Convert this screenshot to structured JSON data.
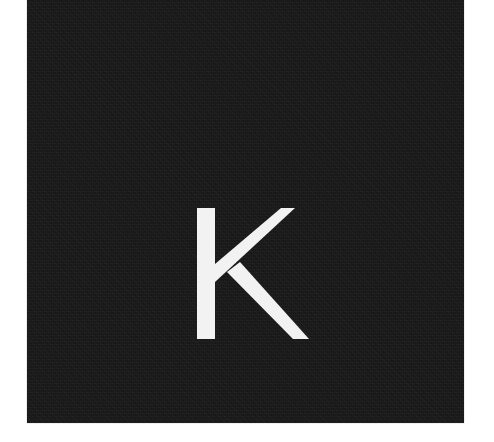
{
  "image": {
    "background_color": "#ffffff",
    "tile": {
      "color": "#1b1b1b"
    },
    "glyph": {
      "text": "K",
      "color": "#f2f2f2"
    }
  }
}
